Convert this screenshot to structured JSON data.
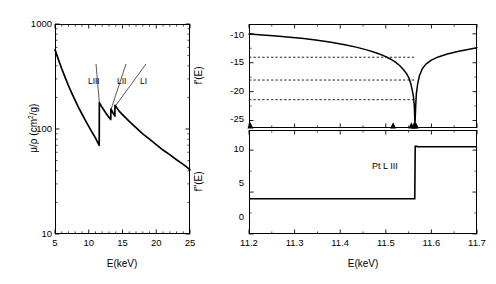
{
  "figure": {
    "title": "",
    "panels": [
      "absorption-coefficient",
      "f-prime",
      "f-double-prime"
    ]
  },
  "panel_left": {
    "ylabel": "μ/ρ (cm",
    "ylabel_sup": "2",
    "ylabel_tail": "/g)",
    "xlabel": "E(keV)",
    "ytick_labels": [
      "1000",
      "100",
      "10"
    ],
    "xtick_labels": [
      "5",
      "10",
      "15",
      "20",
      "25"
    ],
    "edge_labels": [
      "LIII",
      "LII",
      "LI"
    ]
  },
  "panel_top_right": {
    "ylabel": "f'(E)",
    "ytick_labels": [
      "-10",
      "-15",
      "-20",
      "-25"
    ],
    "xtick_labels": []
  },
  "panel_bottom_right": {
    "ylabel": "f''(E)",
    "xlabel": "E(keV)",
    "ytick_labels": [
      "10",
      "5",
      "0"
    ],
    "xtick_labels": [
      "11.2",
      "11.3",
      "11.4",
      "11.5",
      "11.6",
      "11.7"
    ],
    "annotation": "Pt L III"
  },
  "chart_data": [
    {
      "type": "line",
      "id": "mass-absorption-coefficient",
      "title": "",
      "xlabel": "E(keV)",
      "ylabel": "μ/ρ (cm2/g)",
      "xscale": "linear",
      "yscale": "log",
      "xlim": [
        5,
        25
      ],
      "ylim": [
        10,
        1000
      ],
      "xticks": [
        5,
        10,
        15,
        20,
        25
      ],
      "yticks": [
        10,
        100,
        1000
      ],
      "grid": false,
      "legend": null,
      "annotations": [
        {
          "text": "LIII",
          "energy_keV": 11.564,
          "label_x_keV": 11.0,
          "label_y": 210
        },
        {
          "text": "LII",
          "energy_keV": 13.273,
          "label_x_keV": 13.1,
          "label_y": 210
        },
        {
          "text": "LI",
          "energy_keV": 13.88,
          "label_x_keV": 14.6,
          "label_y": 210
        }
      ],
      "x": [
        5.0,
        5.5,
        6.0,
        6.5,
        7.0,
        7.5,
        8.0,
        8.5,
        9.0,
        9.5,
        10.0,
        10.5,
        11.0,
        11.55,
        11.57,
        12.0,
        12.5,
        13.0,
        13.26,
        13.28,
        13.6,
        13.87,
        13.89,
        14.5,
        15.0,
        16.0,
        17.0,
        18.0,
        19.0,
        20.0,
        21.0,
        22.0,
        23.0,
        24.0,
        25.0
      ],
      "y": [
        570,
        460,
        375,
        310,
        258,
        218,
        186,
        160,
        139,
        121,
        106,
        93,
        82,
        70,
        178,
        160,
        143,
        129,
        123,
        155,
        142,
        133,
        168,
        148,
        137,
        118,
        103,
        90,
        80,
        71,
        63,
        57,
        51,
        46,
        41
      ]
    },
    {
      "type": "line",
      "id": "f-prime-dispersion",
      "title": "",
      "xlabel": "",
      "ylabel": "f'(E)",
      "xlim": [
        11.2,
        11.7
      ],
      "ylim": [
        -26.3,
        -8.3
      ],
      "xticks": [
        11.2,
        11.3,
        11.4,
        11.5,
        11.6,
        11.7
      ],
      "yticks": [
        -10,
        -15,
        -20,
        -25
      ],
      "grid": false,
      "legend": null,
      "x": [
        11.2,
        11.23,
        11.26,
        11.29,
        11.32,
        11.35,
        11.38,
        11.41,
        11.435,
        11.46,
        11.48,
        11.495,
        11.51,
        11.522,
        11.532,
        11.54,
        11.546,
        11.551,
        11.555,
        11.558,
        11.5605,
        11.5625,
        11.564,
        11.5655,
        11.567,
        11.57,
        11.574,
        11.58,
        11.588,
        11.6,
        11.615,
        11.635,
        11.66,
        11.68,
        11.7
      ],
      "y": [
        -10.05,
        -10.2,
        -10.38,
        -10.58,
        -10.82,
        -11.1,
        -11.44,
        -11.88,
        -12.3,
        -12.82,
        -13.32,
        -13.78,
        -14.35,
        -14.95,
        -15.62,
        -16.32,
        -16.95,
        -17.7,
        -18.7,
        -19.75,
        -20.8,
        -22.4,
        -25.8,
        -22.6,
        -20.4,
        -18.6,
        -17.2,
        -16.05,
        -15.25,
        -14.55,
        -14.0,
        -13.48,
        -13.0,
        -12.7,
        -12.4
      ],
      "hlines": [
        {
          "y": -14.05,
          "style": "dashed",
          "x_from": 11.2,
          "x_to": 11.564
        },
        {
          "y": -18.0,
          "style": "dashed",
          "x_from": 11.2,
          "x_to": 11.564
        },
        {
          "y": -21.4,
          "style": "dashed",
          "x_from": 11.2,
          "x_to": 11.564
        }
      ],
      "markers": {
        "shape": "triangle-up",
        "y": -25.9,
        "x": [
          11.203,
          11.516,
          11.556,
          11.562,
          11.566
        ]
      }
    },
    {
      "type": "line",
      "id": "f-double-prime-absorption",
      "title": "",
      "xlabel": "E(keV)",
      "ylabel": "f''(E)",
      "xlim": [
        11.2,
        11.7
      ],
      "ylim": [
        0,
        12.4
      ],
      "xticks": [
        11.2,
        11.3,
        11.4,
        11.5,
        11.6,
        11.7
      ],
      "yticks": [
        0,
        5,
        10
      ],
      "grid": false,
      "legend": null,
      "annotations": [
        {
          "text": "Pt L III",
          "x_keV": 11.508,
          "y": 8.0
        }
      ],
      "x": [
        11.2,
        11.4,
        11.5,
        11.55,
        11.5635,
        11.5645,
        11.567,
        11.57,
        11.6,
        11.65,
        11.7
      ],
      "y": [
        4.2,
        4.2,
        4.2,
        4.2,
        4.2,
        10.45,
        10.45,
        10.42,
        10.4,
        10.4,
        10.4
      ]
    }
  ]
}
